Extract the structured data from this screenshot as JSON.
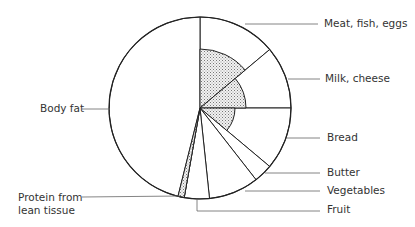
{
  "chart_data": {
    "type": "pie",
    "title": "",
    "center": [
      200,
      108
    ],
    "radius": 91,
    "slices": [
      {
        "name": "Meat, fish, eggs",
        "start_deg": 0,
        "end_deg": 50,
        "inner_shaded_radius": 59
      },
      {
        "name": "Milk, cheese",
        "start_deg": 50,
        "end_deg": 90,
        "inner_shaded_radius": 46
      },
      {
        "name": "Bread",
        "start_deg": 90,
        "end_deg": 130,
        "inner_shaded_radius": 35
      },
      {
        "name": "Butter",
        "start_deg": 130,
        "end_deg": 142,
        "inner_shaded_radius": 0
      },
      {
        "name": "Vegetables",
        "start_deg": 142,
        "end_deg": 174,
        "inner_shaded_radius": 0
      },
      {
        "name": "Fruit",
        "start_deg": 174,
        "end_deg": 190,
        "inner_shaded_radius": 0
      },
      {
        "name": "Protein from lean tissue",
        "start_deg": 190,
        "end_deg": 194,
        "inner_shaded_radius": 91
      },
      {
        "name": "Body fat",
        "start_deg": 194,
        "end_deg": 360,
        "inner_shaded_radius": 0
      }
    ],
    "legend_position": "callout labels"
  },
  "labels": {
    "meat": "Meat, fish, eggs",
    "milk": "Milk, cheese",
    "bread": "Bread",
    "butter": "Butter",
    "vegetables": "Vegetables",
    "fruit": "Fruit",
    "body_fat": "Body fat",
    "protein_line1": "Protein from",
    "protein_line2": "lean tissue"
  }
}
